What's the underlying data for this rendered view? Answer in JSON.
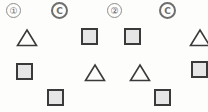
{
  "scene": {
    "width": 208,
    "height": 112,
    "background_color": "#fdfdfc",
    "description": "Scatter of outlined triangles and gray filled squares beneath a row of circled labels"
  },
  "palette": {
    "shape_outline": "#3a3a3a",
    "square_fill": "#e6e6e6",
    "badge_ring_gray": "#6e6e6e",
    "badge_ring_light": "#8d8d8d",
    "badge_text": "#5f5f5f"
  },
  "legend_row": {
    "items": [
      {
        "id": "badge-1",
        "label": "①",
        "kind": "circled-number",
        "x": 6,
        "y": 3
      },
      {
        "id": "badge-c1",
        "label": "C",
        "kind": "circled-letter",
        "x": 51,
        "y": 2
      },
      {
        "id": "badge-2",
        "label": "②",
        "kind": "circled-number",
        "x": 107,
        "y": 3
      },
      {
        "id": "badge-c2",
        "label": "C",
        "kind": "circled-letter",
        "x": 159,
        "y": 2
      }
    ]
  },
  "markers": {
    "row_1": [
      {
        "id": "m1",
        "shape": "triangle",
        "x": 16,
        "y": 28
      },
      {
        "id": "m2",
        "shape": "square",
        "x": 81,
        "y": 28
      },
      {
        "id": "m3",
        "shape": "square",
        "x": 124,
        "y": 28
      },
      {
        "id": "m4",
        "shape": "triangle",
        "x": 189,
        "y": 28
      }
    ],
    "row_2": [
      {
        "id": "m5",
        "shape": "square",
        "x": 16,
        "y": 63
      },
      {
        "id": "m6",
        "shape": "triangle",
        "x": 84,
        "y": 63
      },
      {
        "id": "m7",
        "shape": "triangle",
        "x": 129,
        "y": 63
      },
      {
        "id": "m8",
        "shape": "square",
        "x": 191,
        "y": 61
      }
    ],
    "row_3": [
      {
        "id": "m9",
        "shape": "square",
        "x": 47,
        "y": 89
      },
      {
        "id": "m10",
        "shape": "square",
        "x": 154,
        "y": 89
      }
    ]
  }
}
